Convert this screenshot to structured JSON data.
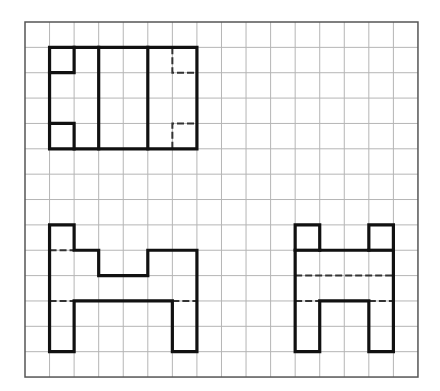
{
  "drawing": {
    "type": "orthographic-projection-views",
    "grid": {
      "origin_x": 25,
      "origin_y": 22,
      "cols": 16,
      "rows": 14,
      "cell_w": 24.56,
      "cell_h": 25.36,
      "line_color": "#b5b5b5",
      "border_color": "#555555"
    },
    "stroke": {
      "solid_color": "#111111",
      "solid_width": 3.2,
      "dashed_color": "#333333",
      "dashed_width": 2,
      "dash_pattern": "7,3"
    },
    "views": [
      {
        "name": "top-view",
        "solid": [
          [
            [
              1,
              1
            ],
            [
              7,
              1
            ],
            [
              7,
              5
            ],
            [
              1,
              5
            ],
            [
              1,
              1
            ]
          ],
          [
            [
              1,
              2
            ],
            [
              2,
              2
            ],
            [
              2,
              1
            ]
          ],
          [
            [
              1,
              4
            ],
            [
              2,
              4
            ],
            [
              2,
              5
            ]
          ],
          [
            [
              3,
              1
            ],
            [
              3,
              5
            ]
          ],
          [
            [
              5,
              1
            ],
            [
              5,
              5
            ]
          ]
        ],
        "dashed": [
          [
            [
              6,
              1
            ],
            [
              6,
              2
            ],
            [
              7,
              2
            ]
          ],
          [
            [
              6,
              5
            ],
            [
              6,
              4
            ],
            [
              7,
              4
            ]
          ]
        ]
      },
      {
        "name": "front-view",
        "solid": [
          [
            [
              1,
              8
            ],
            [
              2,
              8
            ],
            [
              2,
              9
            ],
            [
              3,
              9
            ],
            [
              3,
              10
            ],
            [
              5,
              10
            ],
            [
              5,
              9
            ],
            [
              7,
              9
            ],
            [
              7,
              13
            ],
            [
              6,
              13
            ],
            [
              6,
              11
            ],
            [
              2,
              11
            ],
            [
              2,
              13
            ],
            [
              1,
              13
            ],
            [
              1,
              8
            ]
          ]
        ],
        "dashed": [
          [
            [
              1,
              9
            ],
            [
              2,
              9
            ]
          ],
          [
            [
              1,
              11
            ],
            [
              2,
              11
            ]
          ],
          [
            [
              6,
              11
            ],
            [
              7,
              11
            ]
          ]
        ]
      },
      {
        "name": "side-view",
        "solid": [
          [
            [
              11,
              8
            ],
            [
              12,
              8
            ],
            [
              12,
              9
            ],
            [
              14,
              9
            ],
            [
              14,
              8
            ],
            [
              15,
              8
            ],
            [
              15,
              13
            ],
            [
              14,
              13
            ],
            [
              14,
              11
            ],
            [
              12,
              11
            ],
            [
              12,
              13
            ],
            [
              11,
              13
            ],
            [
              11,
              8
            ]
          ],
          [
            [
              11,
              9
            ],
            [
              12,
              9
            ]
          ],
          [
            [
              14,
              9
            ],
            [
              15,
              9
            ]
          ]
        ],
        "dashed": [
          [
            [
              11,
              10
            ],
            [
              15,
              10
            ]
          ],
          [
            [
              11,
              11
            ],
            [
              12,
              11
            ]
          ],
          [
            [
              14,
              11
            ],
            [
              15,
              11
            ]
          ]
        ]
      }
    ]
  }
}
